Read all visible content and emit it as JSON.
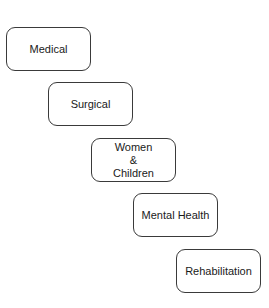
{
  "diagram": {
    "type": "staircase",
    "nodes": [
      {
        "id": "medical",
        "label": "Medical",
        "x": 6,
        "y": 27
      },
      {
        "id": "surgical",
        "label": "Surgical",
        "x": 48,
        "y": 82
      },
      {
        "id": "women-children",
        "label": "Women\n&\nChildren",
        "x": 91,
        "y": 138
      },
      {
        "id": "mental-health",
        "label": "Mental Health",
        "x": 133,
        "y": 193
      },
      {
        "id": "rehabilitation",
        "label": "Rehabilitation",
        "x": 176,
        "y": 249
      }
    ],
    "edges": []
  }
}
